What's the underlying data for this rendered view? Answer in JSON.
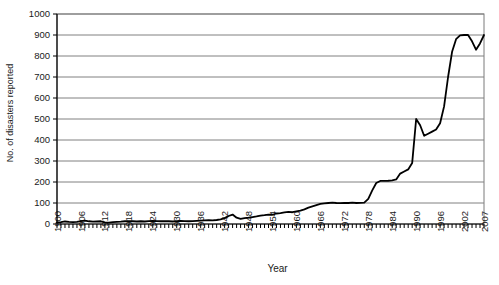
{
  "chart_data": {
    "type": "line",
    "title": "",
    "xlabel": "Year",
    "ylabel": "No. of disasters reported",
    "xlim": [
      1900,
      2007
    ],
    "ylim": [
      0,
      1000
    ],
    "ytick_step": 100,
    "grid": true,
    "legend": "none",
    "line_color": "#000000",
    "grid_color": "#808080",
    "axis_color": "#000000",
    "background": "#ffffff",
    "yticks": [
      "0",
      "100",
      "200",
      "300",
      "400",
      "500",
      "600",
      "700",
      "800",
      "900",
      "1000"
    ],
    "xticks": [
      "1900",
      "1906",
      "1912",
      "1918",
      "1924",
      "1930",
      "1936",
      "1942",
      "1948",
      "1954",
      "1960",
      "1966",
      "1972",
      "1978",
      "1984",
      "1990",
      "1996",
      "2002",
      "2007"
    ],
    "x": [
      1900,
      1901,
      1902,
      1903,
      1904,
      1905,
      1906,
      1907,
      1908,
      1909,
      1910,
      1911,
      1912,
      1913,
      1914,
      1915,
      1916,
      1917,
      1918,
      1919,
      1920,
      1921,
      1922,
      1923,
      1924,
      1925,
      1926,
      1927,
      1928,
      1929,
      1930,
      1931,
      1932,
      1933,
      1934,
      1935,
      1936,
      1937,
      1938,
      1939,
      1940,
      1941,
      1942,
      1943,
      1944,
      1945,
      1946,
      1947,
      1948,
      1949,
      1950,
      1951,
      1952,
      1953,
      1954,
      1955,
      1956,
      1957,
      1958,
      1959,
      1960,
      1961,
      1962,
      1963,
      1964,
      1965,
      1966,
      1967,
      1968,
      1969,
      1970,
      1971,
      1972,
      1973,
      1974,
      1975,
      1976,
      1977,
      1978,
      1979,
      1980,
      1981,
      1982,
      1983,
      1984,
      1985,
      1986,
      1987,
      1988,
      1989,
      1990,
      1991,
      1992,
      1993,
      1994,
      1995,
      1996,
      1997,
      1998,
      1999,
      2000,
      2001,
      2002,
      2003,
      2004,
      2005,
      2006,
      2007
    ],
    "values": [
      8,
      9,
      12,
      10,
      9,
      10,
      14,
      16,
      13,
      11,
      12,
      13,
      8,
      7,
      9,
      10,
      11,
      13,
      14,
      13,
      12,
      13,
      12,
      14,
      15,
      14,
      13,
      14,
      13,
      12,
      14,
      15,
      14,
      13,
      14,
      15,
      16,
      17,
      18,
      17,
      19,
      22,
      28,
      38,
      45,
      30,
      24,
      28,
      30,
      33,
      36,
      40,
      42,
      45,
      44,
      50,
      52,
      55,
      58,
      56,
      60,
      64,
      70,
      78,
      84,
      90,
      96,
      98,
      100,
      102,
      100,
      99,
      101,
      100,
      102,
      100,
      101,
      102,
      120,
      160,
      195,
      205,
      205,
      206,
      208,
      212,
      240,
      250,
      260,
      290,
      500,
      470,
      420,
      430,
      440,
      450,
      480,
      560,
      700,
      820,
      880,
      898,
      900,
      900,
      870,
      830,
      860,
      900
    ]
  }
}
